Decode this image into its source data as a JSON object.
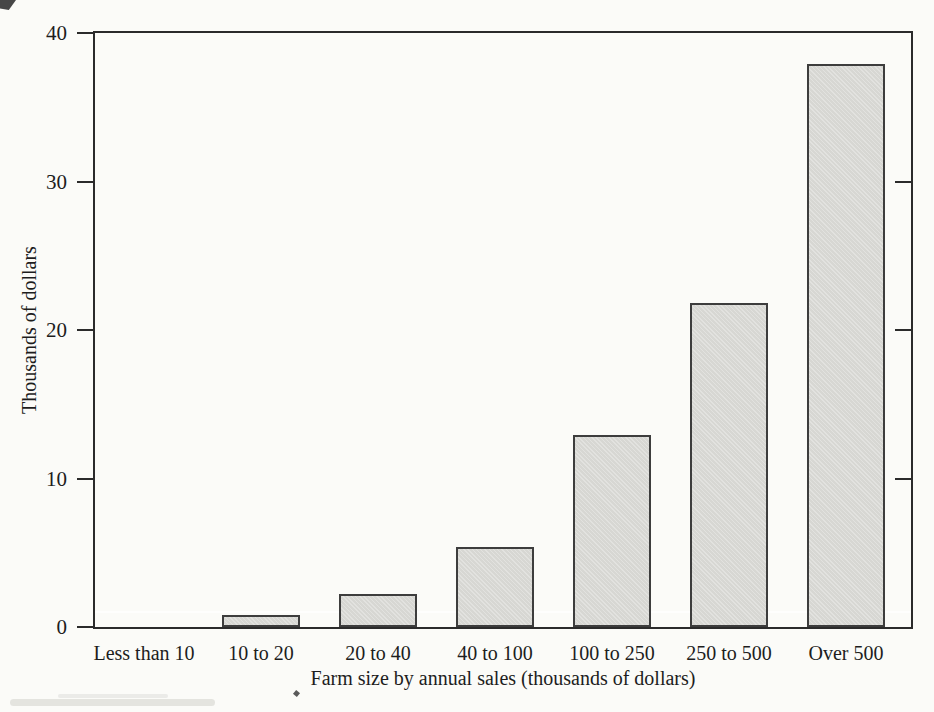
{
  "chart_data": {
    "type": "bar",
    "title": "",
    "categories": [
      "Less than 10",
      "10 to 20",
      "20 to 40",
      "40 to 100",
      "100 to 250",
      "250 to 500",
      "Over 500"
    ],
    "values": [
      0,
      0.8,
      2.2,
      5.4,
      12.9,
      21.8,
      37.9
    ],
    "xlabel": "Farm size by annual sales (thousands of dollars)",
    "ylabel": "Thousands of dollars",
    "ylim": [
      0,
      40
    ],
    "yticks_left": [
      0,
      10,
      20,
      30,
      40
    ],
    "yticks_right": [
      10,
      20,
      30
    ],
    "grid": false,
    "legend": "none",
    "bar_fill": "#d7d7d3",
    "bar_border": "#3d3d3d",
    "axis_color": "#2b2b2b",
    "text_color": "#1d1d1d",
    "background": "#fbfbf8",
    "layout": {
      "bar_width": 78,
      "first_bar_center": 49,
      "bar_center_spacing": 117,
      "tick_length": 16
    }
  }
}
